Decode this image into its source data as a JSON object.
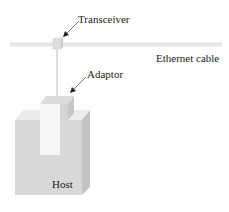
{
  "diagram": {
    "labels": {
      "transceiver": "Transceiver",
      "ethernet_cable": "Ethernet cable",
      "adaptor": "Adaptor",
      "host": "Host"
    },
    "colors": {
      "cable": "#e6e6e6",
      "cable_edge": "#d0d0d0",
      "host_front": "#d6d6d6",
      "host_top": "#ececec",
      "host_side": "#c2c2c2",
      "adaptor_front": "#f7f7f7",
      "adaptor_top": "#dadada",
      "adaptor_side": "#c4c4c4",
      "transceiver": "#dcdcdc",
      "arrow": "#222222"
    }
  }
}
